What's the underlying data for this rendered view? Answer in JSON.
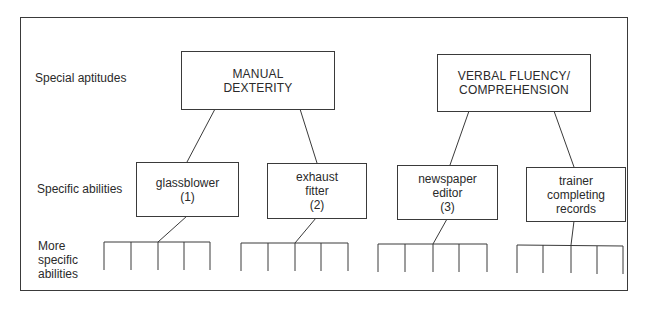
{
  "row_labels": {
    "special_aptitudes": "Special aptitudes",
    "specific_abilities": "Specific abilities",
    "more_specific_abilities": "More\nspecific\nabilities"
  },
  "aptitudes": [
    {
      "label": "MANUAL\nDEXTERITY",
      "abilities": [
        {
          "label": "glassblower\n(1)"
        },
        {
          "label": "exhaust\nfitter\n(2)"
        }
      ]
    },
    {
      "label": "VERBAL FLUENCY/\nCOMPREHENSION",
      "abilities": [
        {
          "label": "newspaper\neditor\n(3)"
        },
        {
          "label": "trainer\ncompleting\nrecords"
        }
      ]
    }
  ],
  "more_specific_abilities_per_ability": 5,
  "colors": {
    "line": "#3a3a3a",
    "text": "#2a2a2a",
    "background": "#ffffff"
  }
}
